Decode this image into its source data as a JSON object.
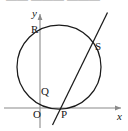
{
  "figure": {
    "kind": "coordinate-geometry-diagram",
    "background_color": "#ffffff",
    "stroke_color": "#1a1a1a",
    "axis_color": "#8a8a8a",
    "width": 128,
    "height": 131
  },
  "axes": {
    "x_axis": {
      "label": "x",
      "label_x": 117,
      "label_y": 112,
      "y": 108,
      "x_start": 4,
      "x_end": 121,
      "arrow": "right"
    },
    "y_axis": {
      "label": "y",
      "label_x": 32,
      "label_y": 8,
      "x": 40,
      "y_start": 128,
      "y_end": 14,
      "arrow": "up"
    },
    "origin_label": "O",
    "origin_label_x": 33,
    "origin_label_y": 109
  },
  "circle": {
    "cx": 59,
    "cy": 67,
    "r": 42
  },
  "line": {
    "x1": 52.5,
    "y1": 125,
    "x2": 107.5,
    "y2": 12.5
  },
  "points": [
    {
      "name": "point-r",
      "label": "R",
      "x": 31,
      "y": 24
    },
    {
      "name": "point-s",
      "label": "S",
      "x": 95,
      "y": 41
    },
    {
      "name": "point-q",
      "label": "Q",
      "x": 41,
      "y": 86
    },
    {
      "name": "point-p",
      "label": "P",
      "x": 61,
      "y": 109
    }
  ],
  "artifacts": {
    "top_cropped_text": "—— ———  ———"
  }
}
